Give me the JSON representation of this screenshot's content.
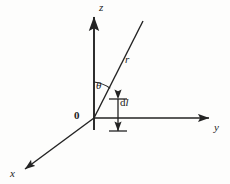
{
  "figure": {
    "kind": "3d-spherical-coordinate-diagram",
    "background_color": "#fdfdfc",
    "stroke_color": "#232323",
    "labels": {
      "z_axis": "z",
      "y_axis": "y",
      "x_axis": "x",
      "radial_line": "r",
      "polar_angle": "θ",
      "origin": "0",
      "length_element_d": "d",
      "length_element_l": "l"
    },
    "geometry": {
      "origin": {
        "x": 94,
        "y": 118
      },
      "z_axis": {
        "arrow_tip": {
          "x": 94,
          "y": 14
        },
        "tail": {
          "x": 94,
          "y": 130
        }
      },
      "y_axis": {
        "arrow_tip": {
          "x": 213,
          "y": 118
        }
      },
      "x_axis": {
        "arrow_tip": {
          "x": 21,
          "y": 172
        }
      },
      "radial_line": {
        "end": {
          "x": 143,
          "y": 21
        }
      },
      "theta_arc": {
        "radius": 36,
        "from_axis": "z",
        "to": "r"
      },
      "dl_marker": {
        "x": 118,
        "top_y": 99,
        "bottom_y": 131,
        "tick_half_width": 9
      }
    }
  }
}
